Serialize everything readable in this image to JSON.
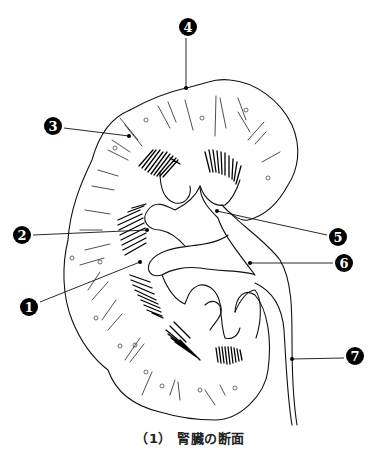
{
  "caption": "（1） 腎臓の断面",
  "colors": {
    "stroke": "#111111",
    "background": "#ffffff",
    "badge": "#000000",
    "badge_text": "#ffffff"
  },
  "labels": [
    {
      "number": "1",
      "glyph": "❶",
      "badge_x": 29,
      "badge_y": 307,
      "target_x": 140,
      "target_y": 262
    },
    {
      "number": "2",
      "glyph": "❷",
      "badge_x": 22,
      "badge_y": 235,
      "target_x": 147,
      "target_y": 230
    },
    {
      "number": "3",
      "glyph": "❸",
      "badge_x": 53,
      "badge_y": 126,
      "target_x": 129,
      "target_y": 136
    },
    {
      "number": "4",
      "glyph": "❹",
      "badge_x": 188,
      "badge_y": 27,
      "target_x": 186,
      "target_y": 88
    },
    {
      "number": "5",
      "glyph": "❺",
      "badge_x": 338,
      "badge_y": 237,
      "target_x": 217,
      "target_y": 211
    },
    {
      "number": "6",
      "glyph": "❻",
      "badge_x": 344,
      "badge_y": 263,
      "target_x": 250,
      "target_y": 263
    },
    {
      "number": "7",
      "glyph": "❼",
      "badge_x": 355,
      "badge_y": 356,
      "target_x": 292,
      "target_y": 359
    }
  ]
}
